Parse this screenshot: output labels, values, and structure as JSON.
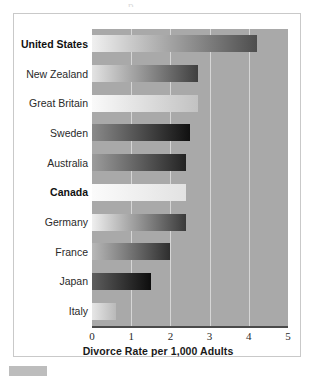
{
  "top_remnant": "p",
  "chart_data": {
    "type": "bar",
    "orientation": "horizontal",
    "title": "",
    "xlabel": "Divorce Rate per 1,000 Adults",
    "ylabel": "",
    "xlim": [
      0,
      5
    ],
    "xticks": [
      "0",
      "1",
      "2",
      "3",
      "4",
      "5"
    ],
    "xtick_values": [
      0,
      1,
      2,
      3,
      4,
      5
    ],
    "grid": true,
    "grid_axis": "x",
    "legend": "none",
    "plot_background": "#a9a9a9",
    "categories": [
      "United States",
      "New Zealand",
      "Great Britain",
      "Sweden",
      "Australia",
      "Canada",
      "Germany",
      "France",
      "Japan",
      "Italy"
    ],
    "values": [
      4.2,
      2.7,
      2.7,
      2.5,
      2.4,
      2.4,
      2.4,
      2.0,
      1.5,
      0.6
    ],
    "bars": [
      {
        "label": "United States",
        "value": 4.2,
        "emphasis": true,
        "fill_start": "#f0f0f0",
        "fill_end": "#4e4e4e"
      },
      {
        "label": "New Zealand",
        "value": 2.7,
        "emphasis": false,
        "fill_start": "#e3e3e3",
        "fill_end": "#3f3f3f"
      },
      {
        "label": "Great Britain",
        "value": 2.7,
        "emphasis": false,
        "fill_start": "#fafafa",
        "fill_end": "#c2c2c2"
      },
      {
        "label": "Sweden",
        "value": 2.5,
        "emphasis": false,
        "fill_start": "#8a8a8a",
        "fill_end": "#101010"
      },
      {
        "label": "Australia",
        "value": 2.4,
        "emphasis": false,
        "fill_start": "#9c9c9c",
        "fill_end": "#232323"
      },
      {
        "label": "Canada",
        "value": 2.4,
        "emphasis": true,
        "fill_start": "#fbfbfb",
        "fill_end": "#e2e2e2"
      },
      {
        "label": "Germany",
        "value": 2.4,
        "emphasis": false,
        "fill_start": "#efefef",
        "fill_end": "#3a3a3a"
      },
      {
        "label": "France",
        "value": 2.0,
        "emphasis": false,
        "fill_start": "#b8b8b8",
        "fill_end": "#2e2e2e"
      },
      {
        "label": "Japan",
        "value": 1.5,
        "emphasis": false,
        "fill_start": "#5e5e5e",
        "fill_end": "#0d0d0d"
      },
      {
        "label": "Italy",
        "value": 0.6,
        "emphasis": false,
        "fill_start": "#e6e6e6",
        "fill_end": "#b9b9b9"
      }
    ]
  }
}
